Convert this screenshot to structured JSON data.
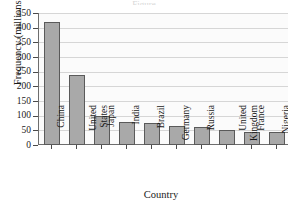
{
  "figure": {
    "title_sliver": "Figure",
    "background": "#ffffff",
    "plot_background": "#fbfbfb",
    "bar_fill": "#a9a9a9",
    "bar_edge": "#5a5a5a",
    "grid_color": "#d6d6d6",
    "axis_color": "#6d6d6d"
  },
  "chart_data": {
    "type": "bar",
    "title": "",
    "xlabel": "Country",
    "ylabel": "Frequency (millions)",
    "categories": [
      "China",
      "United States",
      "Japan",
      "India",
      "Brazil",
      "Germany",
      "Russia",
      "United Kingdom",
      "France",
      "Nigeria"
    ],
    "values": [
      420,
      240,
      100,
      80,
      75,
      64,
      60,
      51,
      45,
      44
    ],
    "ylim": [
      0,
      450
    ],
    "ytick_labels": [
      "0",
      "50",
      "100",
      "150",
      "200",
      "250",
      "300",
      "350",
      "400",
      "450"
    ],
    "ytick_values": [
      0,
      50,
      100,
      150,
      200,
      250,
      300,
      350,
      400,
      450
    ],
    "grid": true,
    "grid_axis": "y",
    "legend": null
  }
}
